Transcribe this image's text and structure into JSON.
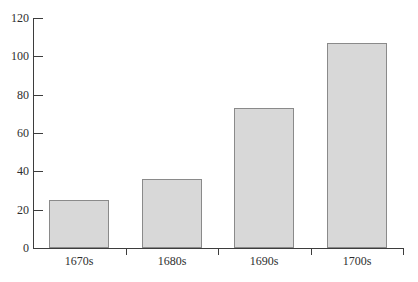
{
  "chart_data": {
    "type": "bar",
    "title": "",
    "xlabel": "",
    "ylabel": "",
    "categories": [
      "1670s",
      "1680s",
      "1690s",
      "1700s"
    ],
    "values": [
      25,
      36,
      73,
      107
    ],
    "ylim": [
      0,
      120
    ],
    "yticks": [
      0,
      20,
      40,
      60,
      80,
      100,
      120
    ],
    "grid": false,
    "legend": false,
    "colors": {
      "bar_fill": "#d8d8d8",
      "bar_border": "#8a8a8a",
      "axis": "#3d3d3d",
      "text": "#2e2e2e",
      "background": "#ffffff"
    }
  }
}
